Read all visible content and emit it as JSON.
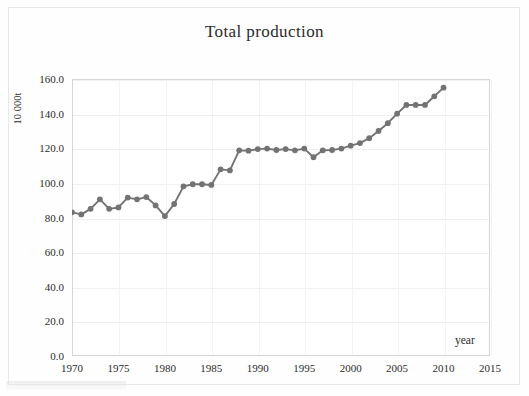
{
  "chart_data": {
    "type": "line",
    "title": "Total production",
    "xlabel": "year",
    "ylabel": "10 000t",
    "xlim": [
      1970,
      2015
    ],
    "ylim": [
      0.0,
      160.0
    ],
    "grid": true,
    "legend": "none",
    "series_color": "#737373",
    "x_ticks": [
      "1970",
      "1975",
      "1980",
      "1985",
      "1990",
      "1995",
      "2000",
      "2005",
      "2010",
      "2015"
    ],
    "y_ticks": [
      "0.0",
      "20.0",
      "40.0",
      "60.0",
      "80.0",
      "100.0",
      "120.0",
      "140.0",
      "160.0"
    ],
    "series": [
      {
        "name": "Total production",
        "x": [
          1970,
          1971,
          1972,
          1973,
          1974,
          1975,
          1976,
          1977,
          1978,
          1979,
          1980,
          1981,
          1982,
          1983,
          1984,
          1985,
          1986,
          1987,
          1988,
          1989,
          1990,
          1991,
          1992,
          1993,
          1994,
          1995,
          1996,
          1997,
          1998,
          1999,
          2000,
          2001,
          2002,
          2003,
          2004,
          2005,
          2006,
          2007,
          2008,
          2009,
          2010
        ],
        "values": [
          83.0,
          81.8,
          85.0,
          90.5,
          85.0,
          85.8,
          91.5,
          90.5,
          91.8,
          87.0,
          80.8,
          87.8,
          98.0,
          99.2,
          99.2,
          98.8,
          107.8,
          107.2,
          118.8,
          118.6,
          119.5,
          119.8,
          119.0,
          119.5,
          118.8,
          119.8,
          114.8,
          118.8,
          119.0,
          119.8,
          121.5,
          123.0,
          125.8,
          130.0,
          134.5,
          140.0,
          145.0,
          145.0,
          145.0,
          150.0,
          155.0
        ]
      }
    ]
  }
}
